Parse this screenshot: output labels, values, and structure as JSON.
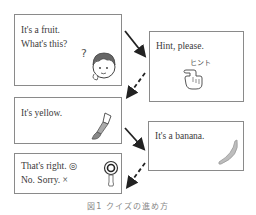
{
  "panels": [
    {
      "id": "question",
      "lines": [
        "It's a fruit.",
        "What's this?"
      ],
      "icon": "thinking-boy-icon"
    },
    {
      "id": "hint-request",
      "lines": [
        "Hint, please."
      ],
      "icon": "pointing-hand-hint-icon",
      "icon_label": "ヒント"
    },
    {
      "id": "hint",
      "lines": [
        "It's yellow."
      ],
      "icon": "paintbrush-icon"
    },
    {
      "id": "answer",
      "lines": [
        "It's a banana."
      ],
      "icon": "banana-icon"
    },
    {
      "id": "feedback",
      "lines": [
        "That's right. ◎",
        "No. Sorry. ×"
      ],
      "icon": "judge-paddle-icon"
    }
  ],
  "arrows": [
    {
      "from": "question",
      "to": "hint-request",
      "style": "solid"
    },
    {
      "from": "hint-request",
      "to": "hint",
      "style": "dashed"
    },
    {
      "from": "hint",
      "to": "answer",
      "style": "solid"
    },
    {
      "from": "answer",
      "to": "feedback",
      "style": "dashed"
    }
  ],
  "caption": "図1 クイズの進め方"
}
